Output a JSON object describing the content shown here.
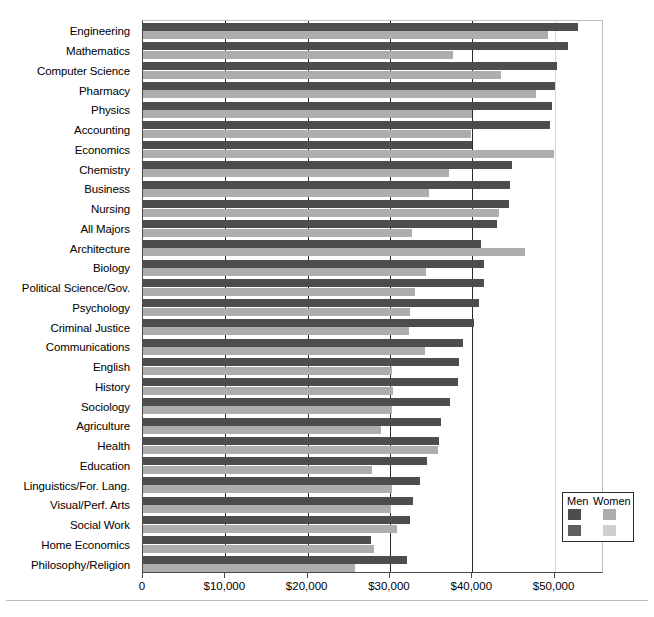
{
  "chart_data": {
    "type": "bar",
    "orientation": "horizontal",
    "title": "",
    "subtitle": "",
    "xlabel": "",
    "ylabel": "",
    "xlim": [
      0,
      56000
    ],
    "grid": true,
    "gridlines_x": [
      0,
      10000,
      20000,
      30000,
      40000,
      50000
    ],
    "legend_position": "bottom-right",
    "legend": {
      "men_label": "Men",
      "women_label": "Women",
      "men_color": "#4d4d4d",
      "women_color": "#adadad",
      "men_color_alt": "#5e5e5e",
      "women_color_alt": "#cfcfcf"
    },
    "xtick_labels": [
      "0",
      "$10,000",
      "$20,000",
      "$30,000",
      "$40,000",
      "$50,000"
    ],
    "xtick_values": [
      0,
      10000,
      20000,
      30000,
      40000,
      50000
    ],
    "categories": [
      "Engineering",
      "Mathematics",
      "Computer Science",
      "Pharmacy",
      "Physics",
      "Accounting",
      "Economics",
      "Chemistry",
      "Business",
      "Nursing",
      "All Majors",
      "Architecture",
      "Biology",
      "Political Science/Gov.",
      "Psychology",
      "Criminal Justice",
      "Communications",
      "English",
      "History",
      "Sociology",
      "Agriculture",
      "Health",
      "Education",
      "Linguistics/For. Lang.",
      "Visual/Perf. Arts",
      "Social Work",
      "Home Economics",
      "Philosophy/Religion"
    ],
    "series": [
      {
        "name": "Men",
        "color": "#4d4d4d",
        "values": [
          52800,
          51600,
          50300,
          50100,
          49700,
          49400,
          40000,
          44800,
          44600,
          44400,
          43000,
          41000,
          41400,
          41400,
          40800,
          40200,
          38900,
          38400,
          38300,
          37300,
          36200,
          35900,
          34500,
          33700,
          32800,
          32400,
          27700,
          32100
        ]
      },
      {
        "name": "Women",
        "color": "#adadad",
        "values": [
          49200,
          37600,
          43500,
          47800,
          40000,
          39900,
          49900,
          37200,
          34800,
          43200,
          32700,
          46400,
          34400,
          33100,
          32400,
          32300,
          34300,
          30300,
          30400,
          30200,
          28900,
          35800,
          27800,
          30200,
          30100,
          30800,
          28100,
          25700
        ]
      }
    ]
  }
}
